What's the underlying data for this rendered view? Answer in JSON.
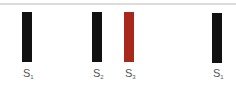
{
  "colors": {
    "divider": "#dcdcdc",
    "label": "#555555"
  },
  "items": [
    {
      "letter": "S",
      "subscript": "1",
      "color": "#111111"
    },
    {
      "letter": "S",
      "subscript": "2",
      "color": "#111111"
    },
    {
      "letter": "S",
      "subscript": "3",
      "color": "#a8281c"
    },
    {
      "letter": "S",
      "subscript": "1",
      "color": "#111111"
    }
  ]
}
